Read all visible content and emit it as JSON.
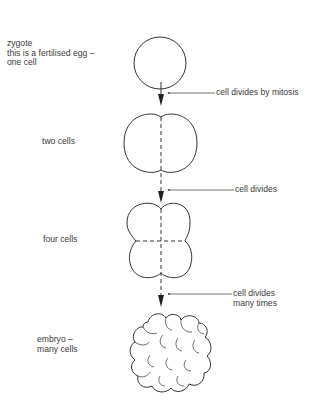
{
  "diagram": {
    "stages": [
      {
        "id": "zygote",
        "label_lines": [
          "zygote",
          "this is a fertilised egg –",
          "one cell"
        ]
      },
      {
        "id": "two-cells",
        "label_lines": [
          "two cells"
        ]
      },
      {
        "id": "four-cells",
        "label_lines": [
          "four cells"
        ]
      },
      {
        "id": "embryo",
        "label_lines": [
          "embryo –",
          "many cells"
        ]
      }
    ],
    "transitions": [
      {
        "label_lines": [
          "cell divides by mitosis"
        ]
      },
      {
        "label_lines": [
          "cell divides"
        ]
      },
      {
        "label_lines": [
          "cell divides",
          "many times"
        ]
      }
    ],
    "colors": {
      "stroke": "#333333",
      "background": "#ffffff",
      "text": "#3a3a3a"
    }
  }
}
